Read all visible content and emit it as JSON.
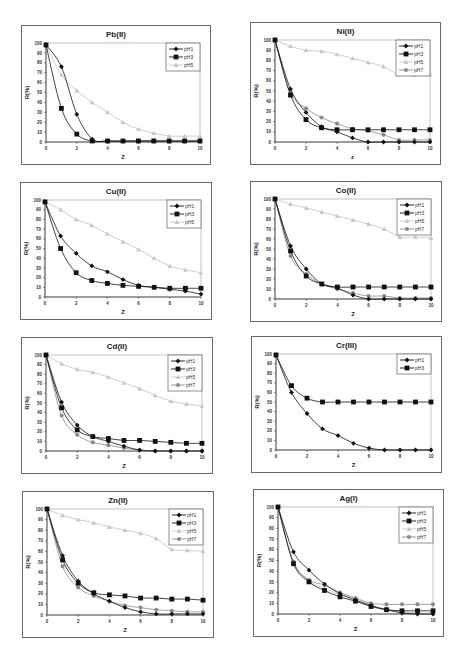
{
  "chart_data": [
    {
      "type": "line",
      "title": "Pb(II)",
      "xlabel": "Z",
      "ylabel": "R(%)",
      "xlim": [
        0,
        10
      ],
      "ylim": [
        0,
        100
      ],
      "xticks": [
        0,
        2,
        4,
        6,
        8,
        10
      ],
      "yticks": [
        0,
        10,
        20,
        30,
        40,
        50,
        60,
        70,
        80,
        90,
        100
      ],
      "x": [
        0,
        1,
        2,
        3,
        4,
        5,
        6,
        7,
        8,
        9,
        10
      ],
      "series": [
        {
          "name": "pH1",
          "values": [
            98,
            76,
            28,
            3,
            1,
            1,
            1,
            1,
            1,
            1,
            1
          ]
        },
        {
          "name": "pH3",
          "values": [
            98,
            34,
            8,
            1,
            1,
            1,
            1,
            1,
            1,
            1,
            1
          ]
        },
        {
          "name": "pH5",
          "values": [
            98,
            68,
            52,
            40,
            30,
            20,
            13,
            9,
            6,
            6,
            6
          ]
        }
      ]
    },
    {
      "type": "line",
      "title": "Ni(II)",
      "xlabel": "z",
      "ylabel": "R(%)",
      "xlim": [
        0,
        10
      ],
      "ylim": [
        0,
        100
      ],
      "xticks": [
        0,
        2,
        4,
        6,
        8,
        10
      ],
      "yticks": [
        0,
        10,
        20,
        30,
        40,
        50,
        60,
        70,
        80,
        90,
        100
      ],
      "x": [
        0,
        1,
        2,
        3,
        4,
        5,
        6,
        7,
        8,
        9,
        10
      ],
      "series": [
        {
          "name": "pH1",
          "values": [
            100,
            52,
            29,
            15,
            10,
            4,
            0,
            0,
            0,
            0,
            0
          ]
        },
        {
          "name": "pH3",
          "values": [
            100,
            46,
            22,
            14,
            12,
            12,
            12,
            12,
            12,
            12,
            12
          ]
        },
        {
          "name": "pH5",
          "values": [
            100,
            94,
            90,
            89,
            86,
            82,
            78,
            74,
            66,
            66,
            66
          ]
        },
        {
          "name": "pH7",
          "values": [
            100,
            48,
            33,
            24,
            18,
            13,
            11,
            7,
            2,
            2,
            2
          ]
        }
      ]
    },
    {
      "type": "line",
      "title": "Cu(II)",
      "xlabel": "Z",
      "ylabel": "R(%)",
      "xlim": [
        0,
        10
      ],
      "ylim": [
        0,
        100
      ],
      "xticks": [
        0,
        2,
        4,
        6,
        8,
        10
      ],
      "yticks": [
        0,
        10,
        20,
        30,
        40,
        50,
        60,
        70,
        80,
        90,
        100
      ],
      "x": [
        0,
        1,
        2,
        3,
        4,
        5,
        6,
        7,
        8,
        9,
        10
      ],
      "series": [
        {
          "name": "pH1",
          "values": [
            98,
            63,
            45,
            32,
            26,
            18,
            12,
            10,
            8,
            6,
            3
          ]
        },
        {
          "name": "pH3",
          "values": [
            98,
            50,
            25,
            17,
            14,
            12,
            11,
            10,
            9,
            9,
            9
          ]
        },
        {
          "name": "pH5",
          "values": [
            98,
            90,
            80,
            74,
            65,
            57,
            49,
            40,
            32,
            28,
            25
          ]
        }
      ]
    },
    {
      "type": "line",
      "title": "Co(II)",
      "xlabel": "Z",
      "ylabel": "R(%)",
      "xlim": [
        0,
        10
      ],
      "ylim": [
        0,
        100
      ],
      "xticks": [
        0,
        2,
        4,
        6,
        8,
        10
      ],
      "yticks": [
        0,
        10,
        20,
        30,
        40,
        50,
        60,
        70,
        80,
        90,
        100
      ],
      "x": [
        0,
        1,
        2,
        3,
        4,
        5,
        6,
        7,
        8,
        9,
        10
      ],
      "series": [
        {
          "name": "pH1",
          "values": [
            100,
            53,
            30,
            15,
            11,
            4,
            0,
            0,
            0,
            0,
            0
          ]
        },
        {
          "name": "pH3",
          "values": [
            100,
            48,
            23,
            15,
            12,
            12,
            12,
            12,
            12,
            12,
            12
          ]
        },
        {
          "name": "pH5",
          "values": [
            100,
            95,
            91,
            87,
            83,
            79,
            75,
            70,
            62,
            62,
            61
          ]
        },
        {
          "name": "pH7",
          "values": [
            100,
            43,
            25,
            15,
            10,
            6,
            3,
            3,
            1,
            1,
            1
          ]
        }
      ]
    },
    {
      "type": "line",
      "title": "Cd(II)",
      "xlabel": "Z",
      "ylabel": "R(%)",
      "xlim": [
        0,
        10
      ],
      "ylim": [
        0,
        100
      ],
      "xticks": [
        0,
        2,
        4,
        6,
        8,
        10
      ],
      "yticks": [
        0,
        10,
        20,
        30,
        40,
        50,
        60,
        70,
        80,
        90,
        100
      ],
      "x": [
        0,
        1,
        2,
        3,
        4,
        5,
        6,
        7,
        8,
        9,
        10
      ],
      "series": [
        {
          "name": "pH1",
          "values": [
            100,
            51,
            27,
            15,
            10,
            5,
            1,
            0,
            0,
            0,
            0
          ]
        },
        {
          "name": "pH3",
          "values": [
            100,
            45,
            22,
            15,
            13,
            11,
            11,
            10,
            9,
            8,
            8
          ]
        },
        {
          "name": "pH5",
          "values": [
            100,
            91,
            85,
            82,
            77,
            71,
            65,
            58,
            52,
            49,
            47
          ]
        },
        {
          "name": "pH7",
          "values": [
            100,
            37,
            17,
            9,
            6,
            3,
            1,
            0,
            0,
            0,
            0
          ]
        }
      ]
    },
    {
      "type": "line",
      "title": "Cr(III)",
      "xlabel": "Z",
      "ylabel": "R(%)",
      "xlim": [
        0,
        10
      ],
      "ylim": [
        0,
        100
      ],
      "xticks": [
        0,
        2,
        4,
        6,
        8,
        10
      ],
      "yticks": [
        0,
        10,
        20,
        30,
        40,
        50,
        60,
        70,
        80,
        90,
        100
      ],
      "x": [
        0,
        1,
        2,
        3,
        4,
        5,
        6,
        7,
        8,
        9,
        10
      ],
      "series": [
        {
          "name": "pH1",
          "values": [
            99,
            60,
            38,
            22,
            15,
            7,
            2,
            0,
            0,
            0,
            0
          ]
        },
        {
          "name": "pH3",
          "values": [
            99,
            67,
            54,
            50,
            50,
            50,
            50,
            50,
            50,
            50,
            50
          ]
        }
      ]
    },
    {
      "type": "line",
      "title": "Zn(II)",
      "xlabel": "Z",
      "ylabel": "R(%)",
      "xlim": [
        0,
        10
      ],
      "ylim": [
        0,
        100
      ],
      "xticks": [
        0,
        2,
        4,
        6,
        8,
        10
      ],
      "yticks": [
        0,
        10,
        20,
        30,
        40,
        50,
        60,
        70,
        80,
        90,
        100
      ],
      "x": [
        0,
        1,
        2,
        3,
        4,
        5,
        6,
        7,
        8,
        9,
        10
      ],
      "series": [
        {
          "name": "pH1",
          "values": [
            100,
            56,
            32,
            20,
            13,
            7,
            3,
            1,
            1,
            1,
            1
          ]
        },
        {
          "name": "pH3",
          "values": [
            100,
            52,
            30,
            21,
            19,
            18,
            16,
            16,
            15,
            15,
            14
          ]
        },
        {
          "name": "pH5",
          "values": [
            100,
            94,
            90,
            87,
            83,
            80,
            77,
            72,
            62,
            61,
            60
          ]
        },
        {
          "name": "pH7",
          "values": [
            100,
            46,
            26,
            18,
            13,
            9,
            7,
            5,
            4,
            3,
            3
          ]
        }
      ]
    },
    {
      "type": "line",
      "title": "Ag(I)",
      "xlabel": "Z",
      "ylabel": "R(%)",
      "xlim": [
        0,
        10
      ],
      "ylim": [
        0,
        100
      ],
      "xticks": [
        0,
        2,
        4,
        6,
        8,
        10
      ],
      "yticks": [
        0,
        10,
        20,
        30,
        40,
        50,
        60,
        70,
        80,
        90,
        100
      ],
      "x": [
        0,
        1,
        2,
        3,
        4,
        5,
        6,
        7,
        8,
        9,
        10
      ],
      "series": [
        {
          "name": "pH1",
          "values": [
            100,
            58,
            41,
            28,
            19,
            13,
            8,
            4,
            1,
            0,
            0
          ]
        },
        {
          "name": "pH3",
          "values": [
            100,
            47,
            30,
            22,
            16,
            12,
            7,
            4,
            3,
            3,
            3
          ]
        },
        {
          "name": "pH5",
          "values": [
            100,
            48,
            31,
            24,
            18,
            14,
            8,
            4,
            2,
            1,
            1
          ]
        },
        {
          "name": "pH7",
          "values": [
            100,
            49,
            32,
            27,
            20,
            15,
            10,
            9,
            9,
            9,
            9
          ]
        }
      ]
    }
  ],
  "panels": [
    {
      "title": "Pb(II)",
      "xlabel": "Z",
      "ylabel": "R(%)",
      "legend": [
        "pH1",
        "pH3",
        "pH5"
      ]
    },
    {
      "title": "Ni(II)",
      "xlabel": "z",
      "ylabel": "R(%)",
      "legend": [
        "pH1",
        "pH3",
        "pH5",
        "pH7"
      ]
    },
    {
      "title": "Cu(II)",
      "xlabel": "Z",
      "ylabel": "R(%)",
      "legend": [
        "pH1",
        "pH3",
        "pH5"
      ]
    },
    {
      "title": "Co(II)",
      "xlabel": "Z",
      "ylabel": "R(%)",
      "legend": [
        "pH1",
        "pH3",
        "pH5",
        "pH7"
      ]
    },
    {
      "title": "Cd(II)",
      "xlabel": "Z",
      "ylabel": "R(%)",
      "legend": [
        "pH1",
        "pH3",
        "pH5",
        "pH7"
      ]
    },
    {
      "title": "Cr(III)",
      "xlabel": "Z",
      "ylabel": "R(%)",
      "legend": [
        "pH1",
        "pH3"
      ]
    },
    {
      "title": "Zn(II)",
      "xlabel": "Z",
      "ylabel": "R(%)",
      "legend": [
        "pH1",
        "pH3",
        "pH5",
        "pH7"
      ]
    },
    {
      "title": "Ag(I)",
      "xlabel": "Z",
      "ylabel": "R(%)",
      "legend": [
        "pH1",
        "pH3",
        "pH5",
        "pH7"
      ]
    }
  ],
  "series_styles": {
    "pH1": {
      "color": "#111111",
      "marker": "diamond"
    },
    "pH3": {
      "color": "#111111",
      "marker": "square"
    },
    "pH5": {
      "color": "#c8c8c8",
      "marker": "triangle"
    },
    "pH7": {
      "color": "#8a8a8a",
      "marker": "circle"
    }
  }
}
